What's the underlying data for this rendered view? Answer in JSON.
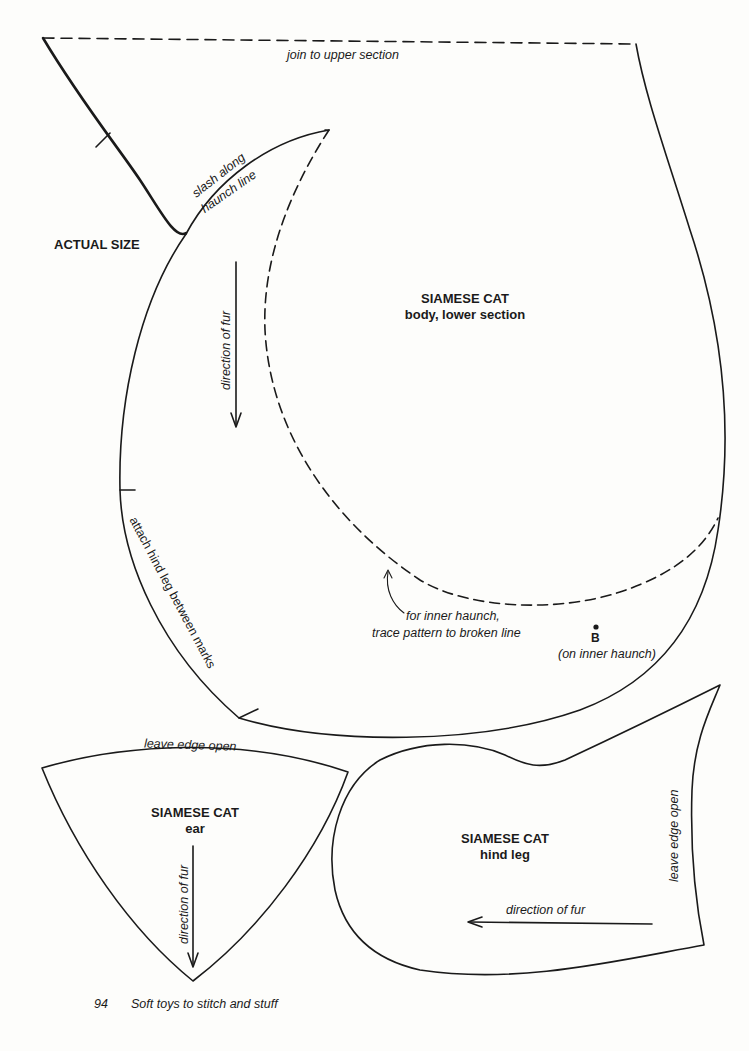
{
  "page": {
    "number": "94",
    "footer_title": "Soft toys to stitch and stuff",
    "scale_note": "ACTUAL SIZE"
  },
  "pieces": {
    "body_lower": {
      "title": "SIAMESE CAT",
      "subtitle": "body, lower section",
      "labels": {
        "join": "join to upper section",
        "slash_line1": "slash along",
        "slash_line2": "haunch line",
        "direction": "direction of fur",
        "attach": "attach hind leg between marks",
        "inner_haunch_line1": "for inner haunch,",
        "inner_haunch_line2": "trace pattern to broken line",
        "point_b": "B",
        "point_b_note": "(on inner haunch)"
      }
    },
    "ear": {
      "title": "SIAMESE CAT",
      "subtitle": "ear",
      "labels": {
        "open_edge": "leave edge open",
        "direction": "direction of fur"
      }
    },
    "hind_leg": {
      "title": "SIAMESE CAT",
      "subtitle": "hind leg",
      "labels": {
        "open_edge": "leave edge open",
        "direction": "direction of fur"
      }
    }
  },
  "colors": {
    "ink": "#1a1a1a",
    "paper": "#fdfdfb"
  }
}
